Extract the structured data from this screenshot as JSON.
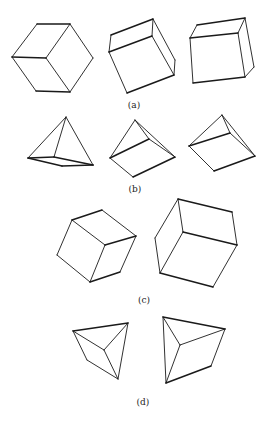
{
  "figure": {
    "groups": [
      {
        "id": "a",
        "label": "(a)",
        "label_pos": [
          134,
          108
        ],
        "shapes": [
          {
            "name": "cube-a1",
            "edges": [
              [
                [
                  37,
                  24
                ],
                [
                  70,
                  24
                ],
                "thick"
              ],
              [
                [
                  70,
                  24
                ],
                [
                  93,
                  58
                ],
                "thin"
              ],
              [
                [
                  93,
                  58
                ],
                [
                  70,
                  92
                ],
                "thin"
              ],
              [
                [
                  70,
                  92
                ],
                [
                  36,
                  91
                ],
                "thick"
              ],
              [
                [
                  36,
                  91
                ],
                [
                  12,
                  57
                ],
                "thin"
              ],
              [
                [
                  12,
                  57
                ],
                [
                  37,
                  24
                ],
                "thin"
              ],
              [
                [
                  12,
                  57
                ],
                [
                  46,
                  58
                ],
                "thick"
              ],
              [
                [
                  46,
                  58
                ],
                [
                  70,
                  24
                ],
                "thin"
              ],
              [
                [
                  46,
                  58
                ],
                [
                  70,
                  92
                ],
                "thin"
              ]
            ]
          },
          {
            "name": "cube-a2",
            "edges": [
              [
                [
                  111,
                  35
                ],
                [
                  153,
                  19
                ],
                "thick"
              ],
              [
                [
                  153,
                  19
                ],
                [
                  175,
                  60
                ],
                "thin"
              ],
              [
                [
                  175,
                  60
                ],
                [
                  174,
                  75
                ],
                "thin"
              ],
              [
                [
                  174,
                  75
                ],
                [
                  127,
                  93
                ],
                "thick"
              ],
              [
                [
                  127,
                  93
                ],
                [
                  109,
                  52
                ],
                "thin"
              ],
              [
                [
                  109,
                  52
                ],
                [
                  111,
                  35
                ],
                "thin"
              ],
              [
                [
                  109,
                  52
                ],
                [
                  152,
                  36
                ],
                "thick"
              ],
              [
                [
                  152,
                  36
                ],
                [
                  153,
                  19
                ],
                "thin"
              ],
              [
                [
                  152,
                  36
                ],
                [
                  174,
                  75
                ],
                "thin"
              ]
            ]
          },
          {
            "name": "cube-a3",
            "edges": [
              [
                [
                  197,
                  25
                ],
                [
                  245,
                  18
                ],
                "thick"
              ],
              [
                [
                  245,
                  18
                ],
                [
                  254,
                  67
                ],
                "thin"
              ],
              [
                [
                  254,
                  67
                ],
                [
                  245,
                  77
                ],
                "thin"
              ],
              [
                [
                  245,
                  77
                ],
                [
                  193,
                  83
                ],
                "thick"
              ],
              [
                [
                  193,
                  83
                ],
                [
                  190,
                  38
                ],
                "thin"
              ],
              [
                [
                  190,
                  38
                ],
                [
                  197,
                  25
                ],
                "thin"
              ],
              [
                [
                  190,
                  38
                ],
                [
                  238,
                  33
                ],
                "thick"
              ],
              [
                [
                  238,
                  33
                ],
                [
                  245,
                  18
                ],
                "thin"
              ],
              [
                [
                  238,
                  33
                ],
                [
                  245,
                  77
                ],
                "thin"
              ]
            ]
          }
        ]
      },
      {
        "id": "b",
        "label": "(b)",
        "label_pos": [
          135,
          192
        ],
        "shapes": [
          {
            "name": "pyramid-b1",
            "edges": [
              [
                [
                  66,
                  117
                ],
                [
                  28,
                  158
                ],
                "thin"
              ],
              [
                [
                  66,
                  117
                ],
                [
                  93,
                  165
                ],
                "thin"
              ],
              [
                [
                  66,
                  117
                ],
                [
                  54,
                  157
                ],
                "thin"
              ],
              [
                [
                  28,
                  158
                ],
                [
                  54,
                  157
                ],
                "thick"
              ],
              [
                [
                  54,
                  157
                ],
                [
                  93,
                  165
                ],
                "thick"
              ],
              [
                [
                  93,
                  165
                ],
                [
                  62,
                  166
                ],
                "thick"
              ],
              [
                [
                  62,
                  166
                ],
                [
                  28,
                  158
                ],
                "thick"
              ]
            ]
          },
          {
            "name": "pyramid-b2",
            "edges": [
              [
                [
                  135,
                  120
                ],
                [
                  110,
                  158
                ],
                "thin"
              ],
              [
                [
                  135,
                  120
                ],
                [
                  175,
                  157
                ],
                "thin"
              ],
              [
                [
                  135,
                  120
                ],
                [
                  149,
                  139
                ],
                "thin"
              ],
              [
                [
                  110,
                  158
                ],
                [
                  149,
                  139
                ],
                "thick"
              ],
              [
                [
                  149,
                  139
                ],
                [
                  175,
                  157
                ],
                "thin"
              ],
              [
                [
                  175,
                  157
                ],
                [
                  133,
                  177
                ],
                "thick"
              ],
              [
                [
                  133,
                  177
                ],
                [
                  110,
                  158
                ],
                "thin"
              ]
            ]
          },
          {
            "name": "pyramid-b3",
            "edges": [
              [
                [
                  222,
                  115
                ],
                [
                  189,
                  146
                ],
                "thin"
              ],
              [
                [
                  222,
                  115
                ],
                [
                  255,
                  156
                ],
                "thin"
              ],
              [
                [
                  222,
                  115
                ],
                [
                  230,
                  133
                ],
                "thin"
              ],
              [
                [
                  189,
                  146
                ],
                [
                  230,
                  133
                ],
                "thick"
              ],
              [
                [
                  230,
                  133
                ],
                [
                  255,
                  156
                ],
                "thin"
              ],
              [
                [
                  255,
                  156
                ],
                [
                  214,
                  171
                ],
                "thick"
              ],
              [
                [
                  214,
                  171
                ],
                [
                  189,
                  146
                ],
                "thin"
              ]
            ]
          }
        ]
      },
      {
        "id": "c",
        "label": "(c)",
        "label_pos": [
          144,
          303
        ],
        "shapes": [
          {
            "name": "cube-c1",
            "edges": [
              [
                [
                  72,
                  220
                ],
                [
                  102,
                  210
                ],
                "thick"
              ],
              [
                [
                  102,
                  210
                ],
                [
                  136,
                  236
                ],
                "thin"
              ],
              [
                [
                  136,
                  236
                ],
                [
                  120,
                  272
                ],
                "thin"
              ],
              [
                [
                  120,
                  272
                ],
                [
                  90,
                  282
                ],
                "thick"
              ],
              [
                [
                  90,
                  282
                ],
                [
                  57,
                  255
                ],
                "thin"
              ],
              [
                [
                  57,
                  255
                ],
                [
                  72,
                  220
                ],
                "thin"
              ],
              [
                [
                  72,
                  220
                ],
                [
                  105,
                  245
                ],
                "thin"
              ],
              [
                [
                  105,
                  245
                ],
                [
                  136,
                  236
                ],
                "thick"
              ],
              [
                [
                  105,
                  245
                ],
                [
                  90,
                  282
                ],
                "thin"
              ]
            ]
          },
          {
            "name": "cube-c2",
            "edges": [
              [
                [
                  178,
                  199
                ],
                [
                  232,
                  212
                ],
                "thick"
              ],
              [
                [
                  232,
                  212
                ],
                [
                  237,
                  245
                ],
                "thin"
              ],
              [
                [
                  237,
                  245
                ],
                [
                  213,
                  287
                ],
                "thin"
              ],
              [
                [
                  213,
                  287
                ],
                [
                  160,
                  273
                ],
                "thick"
              ],
              [
                [
                  160,
                  273
                ],
                [
                  155,
                  238
                ],
                "thin"
              ],
              [
                [
                  155,
                  238
                ],
                [
                  178,
                  199
                ],
                "thin"
              ],
              [
                [
                  178,
                  199
                ],
                [
                  183,
                  232
                ],
                "thin"
              ],
              [
                [
                  183,
                  232
                ],
                [
                  237,
                  245
                ],
                "thick"
              ],
              [
                [
                  183,
                  232
                ],
                [
                  160,
                  273
                ],
                "thin"
              ]
            ]
          }
        ]
      },
      {
        "id": "d",
        "label": "(d)",
        "label_pos": [
          143,
          405
        ],
        "shapes": [
          {
            "name": "tetra-d1",
            "edges": [
              [
                [
                  73,
                  331
                ],
                [
                  128,
                  323
                ],
                "thick"
              ],
              [
                [
                  128,
                  323
                ],
                [
                  118,
                  379
                ],
                "thin"
              ],
              [
                [
                  118,
                  379
                ],
                [
                  87,
                  360
                ],
                "thin"
              ],
              [
                [
                  87,
                  360
                ],
                [
                  73,
                  331
                ],
                "thin"
              ],
              [
                [
                  73,
                  331
                ],
                [
                  104,
                  350
                ],
                "thin"
              ],
              [
                [
                  128,
                  323
                ],
                [
                  104,
                  350
                ],
                "thin"
              ],
              [
                [
                  104,
                  350
                ],
                [
                  118,
                  379
                ],
                "thin"
              ]
            ]
          },
          {
            "name": "tetra-d2",
            "edges": [
              [
                [
                  163,
                  317
                ],
                [
                  225,
                  329
                ],
                "thick"
              ],
              [
                [
                  225,
                  329
                ],
                [
                  211,
                  366
                ],
                "thin"
              ],
              [
                [
                  211,
                  366
                ],
                [
                  166,
                  383
                ],
                "thick"
              ],
              [
                [
                  166,
                  383
                ],
                [
                  163,
                  317
                ],
                "thin"
              ],
              [
                [
                  163,
                  317
                ],
                [
                  180,
                  345
                ],
                "thin"
              ],
              [
                [
                  225,
                  329
                ],
                [
                  180,
                  345
                ],
                "thin"
              ],
              [
                [
                  180,
                  345
                ],
                [
                  166,
                  383
                ],
                "thin"
              ]
            ]
          }
        ]
      }
    ]
  }
}
